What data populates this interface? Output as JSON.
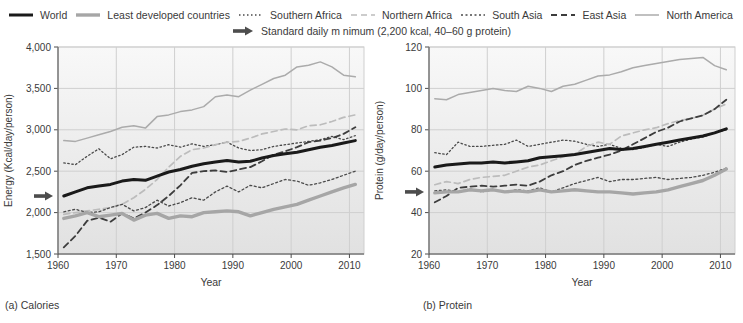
{
  "legend": {
    "items": [
      {
        "key": "world",
        "label": "World"
      },
      {
        "key": "least_developed",
        "label": "Least developed countries"
      },
      {
        "key": "southern_africa",
        "label": "Southern Africa"
      },
      {
        "key": "northern_africa",
        "label": "Northern Africa"
      },
      {
        "key": "south_asia",
        "label": "South Asia"
      },
      {
        "key": "east_asia",
        "label": "East Asia"
      },
      {
        "key": "north_america",
        "label": "North America"
      }
    ],
    "standard": {
      "label": "Standard daily m nimum (2,200 kcal, 40–60 g protein)",
      "icon": "right-arrow-icon",
      "color": "#4d4d4d"
    }
  },
  "styles": {
    "world": {
      "color": "#1a1a1a",
      "width": 3,
      "dash": ""
    },
    "least_developed": {
      "color": "#a6a6a6",
      "width": 3.4,
      "dash": ""
    },
    "southern_africa": {
      "color": "#4a4a4a",
      "width": 1.3,
      "dash": "1.5 2.5"
    },
    "northern_africa": {
      "color": "#bcbcbc",
      "width": 1.7,
      "dash": "6 4"
    },
    "south_asia": {
      "color": "#4a4a4a",
      "width": 1.3,
      "dash": "2 2.5"
    },
    "east_asia": {
      "color": "#3d3d3d",
      "width": 1.8,
      "dash": "6 4"
    },
    "north_america": {
      "color": "#ababab",
      "width": 1.5,
      "dash": ""
    }
  },
  "colors": {
    "grid": "#cfcfcf",
    "axis": "#4d4d4d",
    "bg_top": "#f8f8f8",
    "bg_bottom": "#e1e1e1",
    "text": "#3a3a3a",
    "arrow": "#4d4d4d"
  },
  "chart_data": [
    {
      "type": "line",
      "caption": "(a) Calories",
      "xlabel": "Year",
      "ylabel": "Energy (Kcal/day/person)",
      "xlim": [
        1960,
        2012.5
      ],
      "ylim": [
        1500,
        4000
      ],
      "xticks": [
        1960,
        1970,
        1980,
        1990,
        2000,
        2010
      ],
      "ytick_values": [
        1500,
        2000,
        2500,
        3000,
        3500,
        4000
      ],
      "ytick_labels": [
        "1,500",
        "2,000",
        "2,500",
        "3,000",
        "3,500",
        "4,000"
      ],
      "standard_minimum": 2200,
      "x": [
        1961,
        1963,
        1965,
        1967,
        1969,
        1971,
        1973,
        1975,
        1977,
        1979,
        1981,
        1983,
        1985,
        1987,
        1989,
        1991,
        1993,
        1995,
        1997,
        1999,
        2001,
        2003,
        2005,
        2007,
        2009,
        2011
      ],
      "series": [
        {
          "key": "north_america",
          "name": "North America",
          "values": [
            2870,
            2860,
            2900,
            2940,
            2980,
            3030,
            3050,
            3020,
            3160,
            3180,
            3220,
            3240,
            3280,
            3400,
            3420,
            3400,
            3480,
            3550,
            3620,
            3660,
            3760,
            3780,
            3820,
            3760,
            3660,
            3640
          ]
        },
        {
          "key": "southern_africa",
          "name": "Southern Africa",
          "values": [
            2600,
            2580,
            2680,
            2770,
            2650,
            2700,
            2790,
            2800,
            2780,
            2820,
            2790,
            2830,
            2800,
            2820,
            2850,
            2780,
            2750,
            2760,
            2800,
            2820,
            2840,
            2860,
            2880,
            2920,
            2880,
            2930
          ]
        },
        {
          "key": "northern_africa",
          "name": "Northern Africa",
          "values": [
            1980,
            2000,
            2020,
            2040,
            2060,
            2100,
            2180,
            2280,
            2400,
            2550,
            2680,
            2760,
            2780,
            2820,
            2850,
            2860,
            2900,
            2950,
            2980,
            3010,
            3000,
            3050,
            3060,
            3100,
            3150,
            3180
          ]
        },
        {
          "key": "east_asia",
          "name": "East Asia",
          "values": [
            1580,
            1720,
            1900,
            1940,
            1890,
            1990,
            1930,
            2000,
            2090,
            2200,
            2330,
            2480,
            2500,
            2510,
            2490,
            2520,
            2550,
            2620,
            2700,
            2740,
            2790,
            2850,
            2870,
            2900,
            2950,
            3030
          ]
        },
        {
          "key": "south_asia",
          "name": "South Asia",
          "values": [
            2010,
            2040,
            2000,
            2010,
            2060,
            2100,
            2020,
            2060,
            2150,
            2080,
            2120,
            2180,
            2150,
            2250,
            2320,
            2250,
            2330,
            2300,
            2350,
            2400,
            2380,
            2330,
            2360,
            2400,
            2450,
            2500
          ]
        },
        {
          "key": "least_developed",
          "name": "Least developed countries",
          "values": [
            1930,
            1960,
            2000,
            1950,
            1970,
            1990,
            1910,
            1970,
            1990,
            1930,
            1960,
            1950,
            2000,
            2010,
            2020,
            2010,
            1960,
            2000,
            2040,
            2070,
            2100,
            2150,
            2200,
            2250,
            2300,
            2340
          ]
        },
        {
          "key": "world",
          "name": "World",
          "values": [
            2200,
            2250,
            2300,
            2320,
            2340,
            2380,
            2400,
            2390,
            2440,
            2490,
            2520,
            2560,
            2590,
            2610,
            2630,
            2610,
            2620,
            2660,
            2690,
            2710,
            2730,
            2760,
            2790,
            2810,
            2840,
            2870
          ]
        }
      ]
    },
    {
      "type": "line",
      "caption": "(b) Protein",
      "xlabel": "Year",
      "ylabel": "Protein (g/day/person)",
      "xlim": [
        1960,
        2012.5
      ],
      "ylim": [
        20,
        120
      ],
      "xticks": [
        1960,
        1970,
        1980,
        1990,
        2000,
        2010
      ],
      "ytick_values": [
        20,
        40,
        60,
        80,
        100,
        120
      ],
      "ytick_labels": [
        "20",
        "40",
        "60",
        "80",
        "100",
        "120"
      ],
      "standard_minimum": 50,
      "x": [
        1961,
        1963,
        1965,
        1967,
        1969,
        1971,
        1973,
        1975,
        1977,
        1979,
        1981,
        1983,
        1985,
        1987,
        1989,
        1991,
        1993,
        1995,
        1997,
        1999,
        2001,
        2003,
        2005,
        2007,
        2009,
        2011
      ],
      "series": [
        {
          "key": "north_america",
          "name": "North America",
          "values": [
            95,
            94.5,
            97,
            98,
            99,
            100,
            99,
            98.5,
            101,
            100,
            98.5,
            101,
            102,
            104,
            106,
            106.5,
            108,
            110,
            111,
            112,
            113,
            114,
            114.5,
            115,
            111,
            109
          ]
        },
        {
          "key": "southern_africa",
          "name": "Southern Africa",
          "values": [
            69,
            68,
            74,
            72,
            72,
            72.5,
            73,
            75,
            72,
            73,
            74,
            75,
            74.5,
            73,
            72,
            73,
            71,
            70.5,
            71.5,
            73,
            72,
            74,
            75.5,
            76.5,
            78.5,
            80
          ]
        },
        {
          "key": "northern_africa",
          "name": "Northern Africa",
          "values": [
            53.5,
            55,
            54,
            56,
            57,
            57.5,
            58,
            60,
            62,
            63,
            65,
            67,
            68,
            72,
            74,
            73,
            77,
            78.5,
            80,
            81,
            83,
            84.5,
            85.5,
            87,
            90,
            92.5
          ]
        },
        {
          "key": "east_asia",
          "name": "East Asia",
          "values": [
            45,
            48,
            52,
            52.5,
            53,
            52.5,
            53,
            53.5,
            53,
            55,
            58,
            60,
            63,
            65,
            66.5,
            68,
            70,
            73,
            76,
            79,
            81,
            84,
            85.5,
            87,
            90,
            94.5
          ]
        },
        {
          "key": "south_asia",
          "name": "South Asia",
          "values": [
            50.5,
            51,
            50,
            51.5,
            50,
            51,
            50,
            51,
            50.5,
            52,
            50,
            52,
            54,
            55.5,
            57,
            55,
            56,
            56,
            56.5,
            57,
            56,
            56.5,
            57,
            58,
            59.5,
            61.5
          ]
        },
        {
          "key": "least_developed",
          "name": "Least developed countries",
          "values": [
            49.5,
            50,
            50,
            51,
            50.5,
            51,
            50,
            50.5,
            50,
            51,
            50,
            50.5,
            51,
            50.5,
            50,
            50,
            49.5,
            49,
            49.5,
            50,
            51,
            52.5,
            54,
            55.5,
            58,
            61
          ]
        },
        {
          "key": "world",
          "name": "World",
          "values": [
            62,
            63,
            63.5,
            64,
            64,
            64.5,
            64,
            64.5,
            65,
            66.5,
            67,
            67.5,
            68,
            69,
            70,
            71,
            70.5,
            71,
            72,
            73,
            74,
            75,
            76,
            77,
            78.5,
            80.5
          ]
        }
      ]
    }
  ]
}
